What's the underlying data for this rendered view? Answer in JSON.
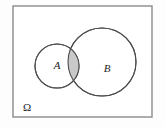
{
  "figure": {
    "type": "venn-diagram",
    "background_color": "#fdfdfd",
    "universe": {
      "label": "Ω",
      "shape": "rectangle",
      "x": 13,
      "y": 6,
      "width": 139,
      "height": 111,
      "stroke": "#8a8a8a",
      "stroke_width": 1.4,
      "fill": "#ffffff",
      "label_x": 27,
      "label_y": 108
    },
    "sets": [
      {
        "label": "A",
        "cx": 57,
        "cy": 66,
        "r": 22,
        "stroke": "#4d4d4d",
        "stroke_width": 1.1,
        "fill": "#ffffff",
        "label_x": 57,
        "label_y": 66
      },
      {
        "label": "B",
        "cx": 102,
        "cy": 62,
        "r": 34,
        "stroke": "#4d4d4d",
        "stroke_width": 1.1,
        "fill": "#ffffff",
        "label_x": 107,
        "label_y": 69
      }
    ],
    "intersection": {
      "name": "A-intersect-B",
      "fill": "#c9c9c9",
      "stroke": "#4d4d4d",
      "stroke_width": 1.1
    }
  }
}
